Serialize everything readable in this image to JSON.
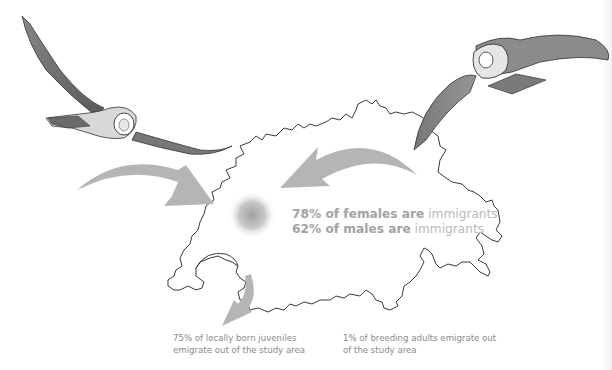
{
  "figure": {
    "type": "migration-illustration",
    "region": "Switzerland outline map"
  },
  "immigration_stats": [
    {
      "bold": "78% of females are",
      "light": " immigrants"
    },
    {
      "bold": "62% of males are",
      "light": " immigrants"
    }
  ],
  "emigration_captions": {
    "juveniles": [
      "75% of locally born juveniles",
      "emigrate out of the study area"
    ],
    "adults": [
      "1% of breeding adults emigrate out",
      "of the study area"
    ]
  },
  "colors": {
    "arrow": "#b5b5b5",
    "map_outline": "#3a3a3a",
    "stat_text": "#a8a8a8",
    "caption_text": "#8a8a8a",
    "hotspot": "#9a9a9a"
  },
  "arrows": [
    {
      "id": "immigration-west",
      "direction": "into study area from left"
    },
    {
      "id": "immigration-east",
      "direction": "into study area from right"
    },
    {
      "id": "emigration-south",
      "direction": "out of study area downward"
    }
  ]
}
